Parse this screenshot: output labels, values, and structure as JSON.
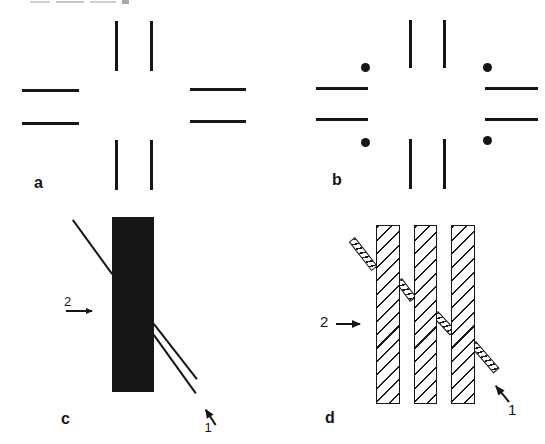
{
  "figure": {
    "background": "#ffffff",
    "ink": "#161616",
    "crop_artifact_color": "#c6c6c6",
    "panel_a": {
      "label": "a"
    },
    "panel_b": {
      "label": "b"
    },
    "panel_c": {
      "label": "c",
      "marker_2": "2",
      "marker_1": "1"
    },
    "panel_d": {
      "label": "d",
      "marker_2": "2",
      "marker_1": "1"
    }
  }
}
